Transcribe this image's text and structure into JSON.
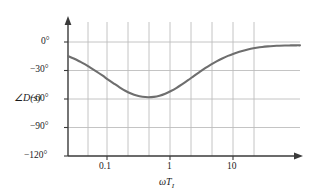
{
  "chart_data": {
    "type": "line",
    "title": "",
    "xlabel": "ωT₁",
    "xlabel_base": "ωT",
    "xlabel_sub": "I",
    "ylabel": "∠D(s)",
    "xscale": "log",
    "xlim": [
      0.03,
      50
    ],
    "ylim": [
      -120,
      10
    ],
    "grid": true,
    "legend": false,
    "xticks": [
      0.1,
      1,
      10
    ],
    "xtick_labels": [
      "0.1",
      "1",
      "10"
    ],
    "yticks": [
      0,
      -30,
      -60,
      -90,
      -120
    ],
    "ytick_labels": [
      "0°",
      "−30°",
      "−60°",
      "−90°",
      "−120°"
    ],
    "series_name": "phase",
    "line_color": "#6e6e6e",
    "grid_color": "#b9b9b9",
    "axis_color": "#3a3a3a",
    "x": [
      0.03,
      0.036,
      0.043,
      0.052,
      0.062,
      0.075,
      0.09,
      0.108,
      0.13,
      0.156,
      0.187,
      0.225,
      0.27,
      0.324,
      0.389,
      0.467,
      0.56,
      0.672,
      0.806,
      0.968,
      1.161,
      1.394,
      1.672,
      2.007,
      2.408,
      2.89,
      3.468,
      4.162,
      4.994,
      5.993,
      7.191,
      8.63,
      10.36,
      12.43,
      14.92,
      17.9,
      21.48,
      25.77,
      30.93,
      37.11,
      44.53,
      50.0
    ],
    "y": [
      -14.8,
      -17.4,
      -20.3,
      -23.6,
      -27.2,
      -31.1,
      -35.2,
      -39.5,
      -43.7,
      -47.7,
      -51.3,
      -54.2,
      -56.4,
      -57.7,
      -58.2,
      -57.8,
      -56.5,
      -54.4,
      -51.6,
      -48.2,
      -44.3,
      -40.2,
      -35.9,
      -31.7,
      -27.6,
      -23.8,
      -20.4,
      -17.3,
      -14.6,
      -12.3,
      -10.3,
      -8.6,
      -7.2,
      -6.1,
      -5.2,
      -4.6,
      -4.2,
      -3.9,
      -3.7,
      -3.6,
      -3.5,
      -3.5
    ],
    "annotations": [],
    "minimum": {
      "x": 0.39,
      "y": -58.2
    }
  },
  "figure": {
    "y_axis_label": "∠D(s)",
    "x_axis_label_base": "ωT",
    "x_axis_label_sub": "I",
    "y_tick_0": "0°",
    "y_tick_1": "−30°",
    "y_tick_2": "−60°",
    "y_tick_3": "−90°",
    "y_tick_4": "−120°",
    "x_tick_0": "0.1",
    "x_tick_1": "1",
    "x_tick_2": "10"
  }
}
